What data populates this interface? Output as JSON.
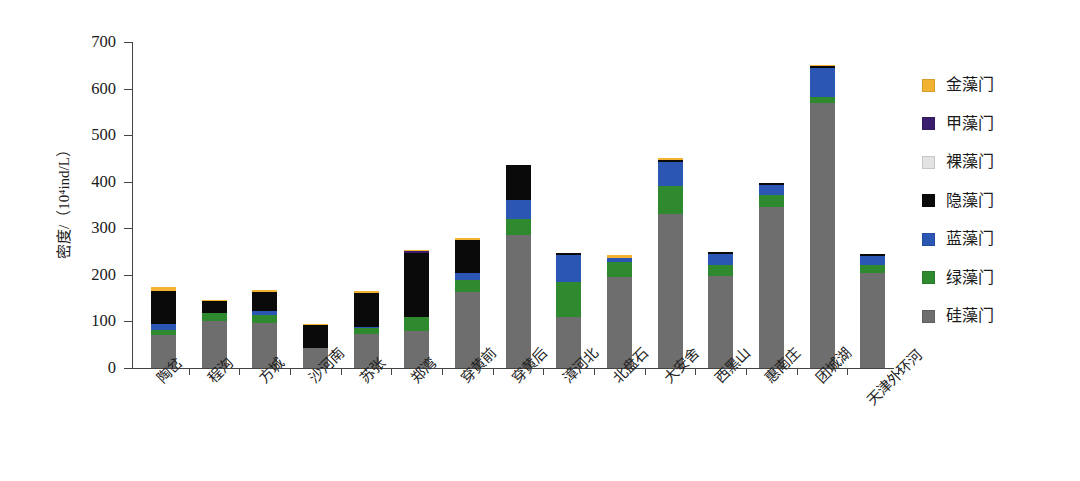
{
  "chart_data": {
    "type": "bar",
    "stacked": true,
    "title": "",
    "xlabel": "",
    "ylabel": "密度/（10⁴ind/L）",
    "ylim": [
      0,
      700
    ],
    "yticks": [
      0,
      100,
      200,
      300,
      400,
      500,
      600,
      700
    ],
    "grid": false,
    "legend_position": "right",
    "categories": [
      "陶岔",
      "程沟",
      "方城",
      "沙河南",
      "苏张",
      "郑湾",
      "穿黄前",
      "穿黄后",
      "漳河北",
      "北盘石",
      "大安舍",
      "西黑山",
      "惠南庄",
      "团城湖",
      "天津外环河"
    ],
    "series": [
      {
        "name": "硅藻门",
        "color": "#6e6e6e",
        "values": [
          70,
          100,
          97,
          42,
          72,
          80,
          163,
          285,
          110,
          195,
          330,
          197,
          345,
          570,
          205
        ]
      },
      {
        "name": "绿藻门",
        "color": "#2f8a2f",
        "values": [
          12,
          18,
          16,
          0,
          13,
          30,
          27,
          35,
          75,
          33,
          60,
          25,
          27,
          12,
          17
        ]
      },
      {
        "name": "蓝藻门",
        "color": "#2b56b4",
        "values": [
          13,
          0,
          9,
          0,
          3,
          0,
          15,
          40,
          58,
          9,
          53,
          23,
          21,
          63,
          18
        ]
      },
      {
        "name": "隐藻门",
        "color": "#0a0a0a",
        "values": [
          70,
          25,
          41,
          50,
          74,
          138,
          70,
          75,
          4,
          0,
          4,
          4,
          4,
          3,
          5
        ]
      },
      {
        "name": "裸藻门",
        "color": "#e3e3e3",
        "values": [
          0,
          0,
          0,
          0,
          0,
          0,
          0,
          0,
          0,
          0,
          0,
          0,
          0,
          0,
          0
        ]
      },
      {
        "name": "甲藻门",
        "color": "#3b1d6e",
        "values": [
          0,
          0,
          0,
          0,
          0,
          4,
          0,
          0,
          0,
          0,
          0,
          0,
          0,
          0,
          0
        ]
      },
      {
        "name": "金藻门",
        "color": "#f2b332",
        "values": [
          10,
          3,
          4,
          3,
          3,
          1,
          5,
          2,
          0,
          5,
          3,
          0,
          0,
          3,
          0
        ]
      }
    ],
    "totals": [
      175,
      146,
      167,
      95,
      165,
      253,
      280,
      437,
      247,
      242,
      450,
      249,
      397,
      651,
      245
    ]
  },
  "legend": {
    "items": [
      {
        "label": "金藻门",
        "color": "#f2b332"
      },
      {
        "label": "甲藻门",
        "color": "#3b1d6e"
      },
      {
        "label": "裸藻门",
        "color": "#e3e3e3"
      },
      {
        "label": "隐藻门",
        "color": "#0a0a0a"
      },
      {
        "label": "蓝藻门",
        "color": "#2b56b4"
      },
      {
        "label": "绿藻门",
        "color": "#2f8a2f"
      },
      {
        "label": "硅藻门",
        "color": "#6e6e6e"
      }
    ]
  }
}
